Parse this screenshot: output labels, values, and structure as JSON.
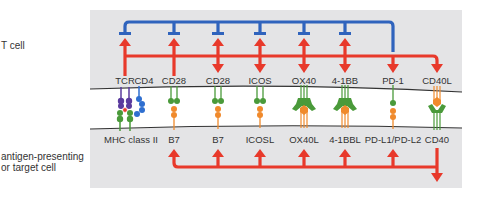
{
  "side_labels": {
    "t_cell": "T cell",
    "apc_line1": "antigen-presenting",
    "apc_line2": "or target cell"
  },
  "colors": {
    "panel": "#e4e4e6",
    "stimulatory": "#e8392b",
    "inhibitory": "#2f63bd",
    "t_cell_molecule": "#4a9a3a",
    "apc_ligand": "#f08a2c",
    "tcr": "#5a3a9e",
    "cd4": "#2f6fd0",
    "membrane": "#333333"
  },
  "t_cell_receptors": [
    {
      "label": "TCR",
      "x": 125
    },
    {
      "label": "CD4",
      "x": 142
    },
    {
      "label": "CD28",
      "x": 174
    },
    {
      "label": "CD28",
      "x": 218
    },
    {
      "label": "ICOS",
      "x": 260
    },
    {
      "label": "OX40",
      "x": 304
    },
    {
      "label": "4-1BB",
      "x": 345
    },
    {
      "label": "PD-1",
      "x": 393
    },
    {
      "label": "CD40L",
      "x": 437
    }
  ],
  "apc_ligands": [
    {
      "label": "MHC class II",
      "x": 131
    },
    {
      "label": "B7",
      "x": 174
    },
    {
      "label": "B7",
      "x": 218
    },
    {
      "label": "ICOSL",
      "x": 260
    },
    {
      "label": "OX40L",
      "x": 304
    },
    {
      "label": "4-1BBL",
      "x": 345
    },
    {
      "label": "PD-L1/PD-L2",
      "x": 393
    },
    {
      "label": "CD40",
      "x": 437
    }
  ],
  "signals": {
    "inhibitory_source": "PD-1",
    "inhibitory_targets": [
      "TCR",
      "CD28",
      "CD28",
      "ICOS",
      "OX40",
      "4-1BB"
    ],
    "stimulatory_bus_t_cell": [
      "TCR",
      "CD28",
      "CD28",
      "ICOS",
      "OX40",
      "4-1BB",
      "PD-1",
      "CD40L"
    ],
    "stimulatory_bus_apc": [
      "B7",
      "B7",
      "ICOSL",
      "OX40L",
      "4-1BBL",
      "PD-L1/PD-L2",
      "CD40"
    ]
  }
}
